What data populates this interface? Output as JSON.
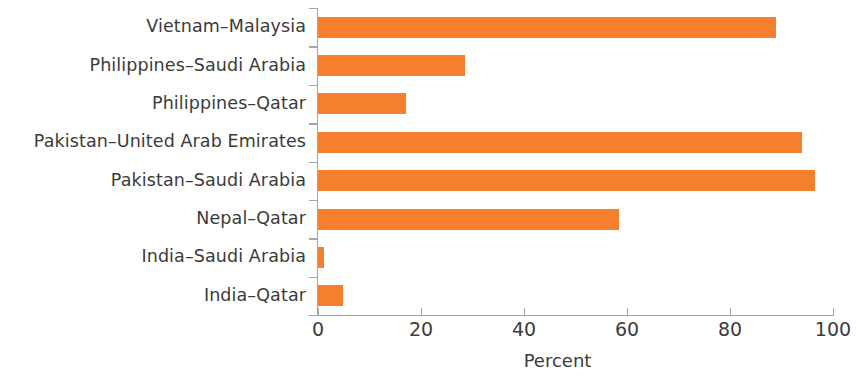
{
  "chart_data": {
    "type": "bar",
    "orientation": "horizontal",
    "title": "",
    "subtitle": "",
    "xlabel": "Percent",
    "ylabel": "",
    "categories": [
      "India–Qatar",
      "India–Saudi Arabia",
      "Nepal–Qatar",
      "Pakistan–Saudi Arabia",
      "Pakistan–United Arab Emirates",
      "Philippines–Qatar",
      "Philippines–Saudi Arabia",
      "Vietnam–Malaysia"
    ],
    "values": [
      4.8,
      1.2,
      58.5,
      96.5,
      94,
      17,
      28.5,
      89
    ],
    "xlim": [
      0,
      100
    ],
    "x_ticks": [
      0,
      20,
      40,
      60,
      80,
      100
    ],
    "x_tick_labels": [
      "0",
      "20",
      "40",
      "60",
      "80",
      "100"
    ],
    "grid": false,
    "legend": null,
    "bar_color": "#F57F2C",
    "axis_color": "#a6a6a6",
    "text_color": "#3b3b3b"
  }
}
